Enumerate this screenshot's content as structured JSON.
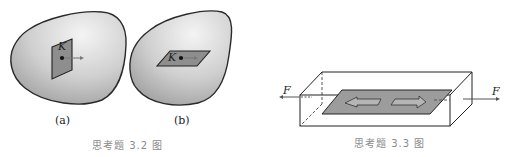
{
  "figure_3_2": {
    "caption": "思考题 3.2 图",
    "subfigures": [
      {
        "label": "(a)",
        "point_label": "K",
        "plane": "vertical section through point K with normal arrow"
      },
      {
        "label": "(b)",
        "point_label": "K",
        "plane": "horizontal section through point K with tangential arrow"
      }
    ]
  },
  "figure_3_3": {
    "caption": "思考题 3.3 图",
    "force_left_label": "F",
    "force_right_label": "F",
    "description": "rectangular bar under axial force F with inclined/longitudinal plane showing opposite shear arrows"
  },
  "colors": {
    "body_fill_light": "#f2f2f2",
    "body_fill_dark": "#a9a9a9",
    "plane_fill": "#9a9a9a",
    "line": "#222222",
    "caption": "#8a8a8a"
  }
}
